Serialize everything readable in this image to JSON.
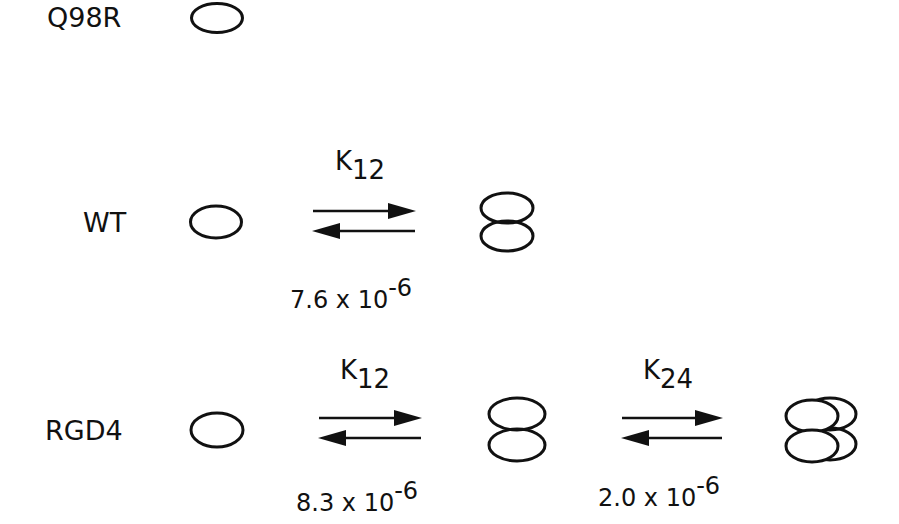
{
  "diagram": {
    "type": "oligomerization-equilibrium-scheme",
    "stroke_color": "#111111",
    "rows": [
      {
        "name": "Q98R",
        "label": "Q98R",
        "species": [
          "monomer"
        ]
      },
      {
        "name": "WT",
        "label": "WT",
        "species": [
          "monomer",
          "dimer"
        ],
        "equilibria": [
          {
            "constant_base": "K",
            "constant_sub": "12",
            "value_mantissa": "7.6 x 10",
            "value_exponent": "-6"
          }
        ]
      },
      {
        "name": "RGD4",
        "label": "RGD4",
        "species": [
          "monomer",
          "dimer",
          "tetramer"
        ],
        "equilibria": [
          {
            "constant_base": "K",
            "constant_sub": "12",
            "value_mantissa": "8.3 x 10",
            "value_exponent": "-6"
          },
          {
            "constant_base": "K",
            "constant_sub": "24",
            "value_mantissa": "2.0 x 10",
            "value_exponent": "-6"
          }
        ]
      }
    ]
  }
}
